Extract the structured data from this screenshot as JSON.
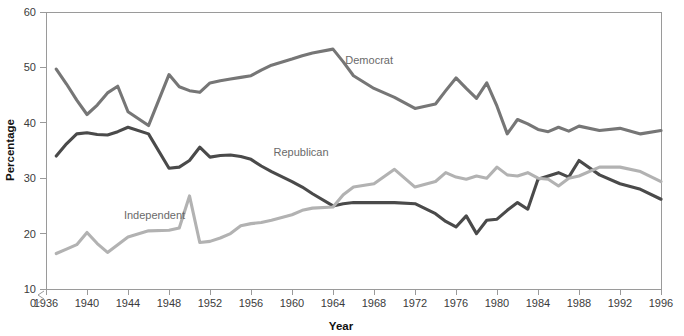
{
  "chart_data": {
    "type": "line",
    "title": "",
    "xlabel": "Year",
    "ylabel": "Percentage",
    "xlim": [
      1936,
      1996
    ],
    "ylim": [
      10,
      60
    ],
    "y_axis_break": true,
    "y_axis_break_label": "0",
    "grid": false,
    "legend": "inline-labels",
    "xticks": [
      1936,
      1940,
      1944,
      1948,
      1952,
      1956,
      1960,
      1964,
      1968,
      1972,
      1976,
      1980,
      1984,
      1988,
      1992,
      1996
    ],
    "xtick_labels": [
      "1936",
      "1940",
      "1944",
      "1948",
      "1952",
      "1956",
      "1960",
      "1964",
      "1968",
      "1972",
      "1976",
      "1980",
      "1984",
      "1988",
      "1992",
      "1996"
    ],
    "yticks": [
      0,
      10,
      20,
      30,
      40,
      50,
      60
    ],
    "ytick_labels": [
      "0",
      "10",
      "20",
      "30",
      "40",
      "50",
      "60"
    ],
    "series": [
      {
        "name": "Democrat",
        "color": "#767676",
        "label_x": 1965.2,
        "label_y": 50.6,
        "x": [
          1937,
          1938,
          1939,
          1940,
          1941,
          1942,
          1943,
          1944,
          1946,
          1948,
          1949,
          1950,
          1951,
          1952,
          1953,
          1954,
          1955,
          1956,
          1957,
          1958,
          1960,
          1961,
          1962,
          1964,
          1965,
          1966,
          1968,
          1970,
          1972,
          1974,
          1975,
          1976,
          1977,
          1978,
          1979,
          1980,
          1981,
          1982,
          1983,
          1984,
          1985,
          1986,
          1987,
          1988,
          1990,
          1992,
          1994,
          1996
        ],
        "y": [
          49.7,
          47.0,
          44.1,
          41.5,
          43.2,
          45.4,
          46.6,
          42.0,
          39.5,
          48.7,
          46.5,
          45.8,
          45.5,
          47.2,
          47.6,
          47.9,
          48.2,
          48.5,
          49.5,
          50.4,
          51.5,
          52.1,
          52.6,
          53.3,
          51.0,
          48.5,
          46.2,
          44.6,
          42.6,
          43.4,
          45.8,
          48.1,
          46.2,
          44.4,
          47.2,
          43.0,
          38.0,
          40.6,
          39.8,
          38.8,
          38.4,
          39.2,
          38.5,
          39.4,
          38.6,
          39.0,
          38.0,
          38.6
        ]
      },
      {
        "name": "Republican",
        "color": "#4a4a4a",
        "label_x": 1958.2,
        "label_y": 34.0,
        "x": [
          1937,
          1938,
          1939,
          1940,
          1941,
          1942,
          1943,
          1944,
          1946,
          1948,
          1949,
          1950,
          1951,
          1952,
          1953,
          1954,
          1955,
          1956,
          1957,
          1958,
          1960,
          1961,
          1962,
          1964,
          1965,
          1966,
          1968,
          1970,
          1972,
          1974,
          1975,
          1976,
          1977,
          1978,
          1979,
          1980,
          1981,
          1982,
          1983,
          1984,
          1985,
          1986,
          1987,
          1988,
          1990,
          1992,
          1994,
          1996
        ],
        "y": [
          34.0,
          36.2,
          38.0,
          38.2,
          37.9,
          37.8,
          38.4,
          39.2,
          38.0,
          31.8,
          32.0,
          33.2,
          35.6,
          33.8,
          34.1,
          34.2,
          33.9,
          33.4,
          32.2,
          31.2,
          29.4,
          28.4,
          27.2,
          25.0,
          25.4,
          25.6,
          25.6,
          25.6,
          25.4,
          23.6,
          22.2,
          21.2,
          23.2,
          20.0,
          22.4,
          22.6,
          24.2,
          25.6,
          24.4,
          29.8,
          30.4,
          31.0,
          30.2,
          33.2,
          30.6,
          29.0,
          28.0,
          26.2
        ]
      },
      {
        "name": "Independent",
        "color": "#b2b2b2",
        "label_x": 1943.6,
        "label_y": 22.6,
        "x": [
          1937,
          1938,
          1939,
          1940,
          1941,
          1942,
          1943,
          1944,
          1946,
          1948,
          1949,
          1950,
          1951,
          1952,
          1953,
          1954,
          1955,
          1956,
          1957,
          1958,
          1960,
          1961,
          1962,
          1964,
          1965,
          1966,
          1968,
          1970,
          1972,
          1974,
          1975,
          1976,
          1977,
          1978,
          1979,
          1980,
          1981,
          1982,
          1983,
          1984,
          1985,
          1986,
          1987,
          1988,
          1990,
          1992,
          1994,
          1996
        ],
        "y": [
          16.4,
          17.2,
          18.0,
          20.2,
          18.2,
          16.6,
          18.0,
          19.4,
          20.5,
          20.6,
          21.0,
          26.8,
          18.4,
          18.6,
          19.2,
          20.0,
          21.4,
          21.8,
          22.0,
          22.4,
          23.4,
          24.2,
          24.6,
          24.8,
          27.0,
          28.4,
          29.0,
          31.6,
          28.4,
          29.4,
          31.0,
          30.2,
          29.8,
          30.4,
          30.0,
          32.0,
          30.6,
          30.4,
          31.0,
          30.0,
          29.8,
          28.6,
          30.0,
          30.4,
          32.0,
          32.0,
          31.2,
          29.4
        ]
      }
    ]
  },
  "axes": {
    "x_title": "Year",
    "y_title": "Percentage"
  }
}
